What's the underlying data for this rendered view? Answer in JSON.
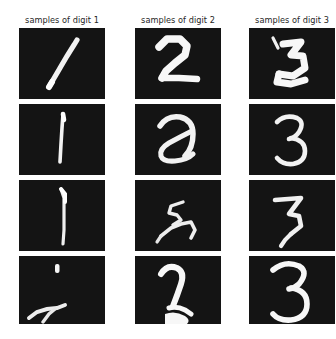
{
  "figure": {
    "background_color": "#ffffff",
    "cell_background_color": "#111111",
    "stroke_color": "#f5f5f5",
    "title_color": "#262626",
    "rows": 4,
    "columns": 3
  },
  "columns": [
    {
      "title": "samples of digit 1",
      "digit": "1",
      "samples": [
        {
          "label": "digit-1-sample-1",
          "description": "steep diagonal stroke from lower-left to upper-right"
        },
        {
          "label": "digit-1-sample-2",
          "description": "thin near-vertical stroke, slight lean"
        },
        {
          "label": "digit-1-sample-3",
          "description": "straight vertical stroke with small top hook"
        },
        {
          "label": "digit-1-sample-4",
          "description": "fragmented mark: small dot above, low sweeping stroke"
        }
      ]
    },
    {
      "title": "samples of digit 2",
      "digit": "2",
      "samples": [
        {
          "label": "digit-2-sample-1",
          "description": "bold angular two with flat base"
        },
        {
          "label": "digit-2-sample-2",
          "description": "rounded looped two resembling a curled a"
        },
        {
          "label": "digit-2-sample-3",
          "description": "small scrawled two, thin zigzag strokes"
        },
        {
          "label": "digit-2-sample-4",
          "description": "thick narrow two with heavy foot"
        }
      ]
    },
    {
      "title": "samples of digit 3",
      "digit": "3",
      "samples": [
        {
          "label": "digit-3-sample-1",
          "description": "sharp angular three with detached tick above"
        },
        {
          "label": "digit-3-sample-2",
          "description": "cursive three with rounded lower bowl"
        },
        {
          "label": "digit-3-sample-3",
          "description": "angular three with flat top bar"
        },
        {
          "label": "digit-3-sample-4",
          "description": "clean rounded three, cropped at bottom"
        }
      ]
    }
  ]
}
